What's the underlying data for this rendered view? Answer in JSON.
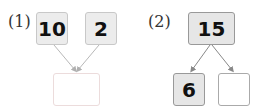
{
  "problems": [
    {
      "label": "(1)",
      "top": [
        {
          "value": "10"
        },
        {
          "value": "2"
        }
      ],
      "bottom": [
        {
          "value": ""
        }
      ]
    },
    {
      "label": "(2)",
      "top": [
        {
          "value": "15"
        }
      ],
      "bottom": [
        {
          "value": "6"
        },
        {
          "value": ""
        }
      ]
    }
  ],
  "colors": {
    "arrow": "#b0b0b0",
    "arrow2": "#888888",
    "box_fill": "#ececec"
  }
}
